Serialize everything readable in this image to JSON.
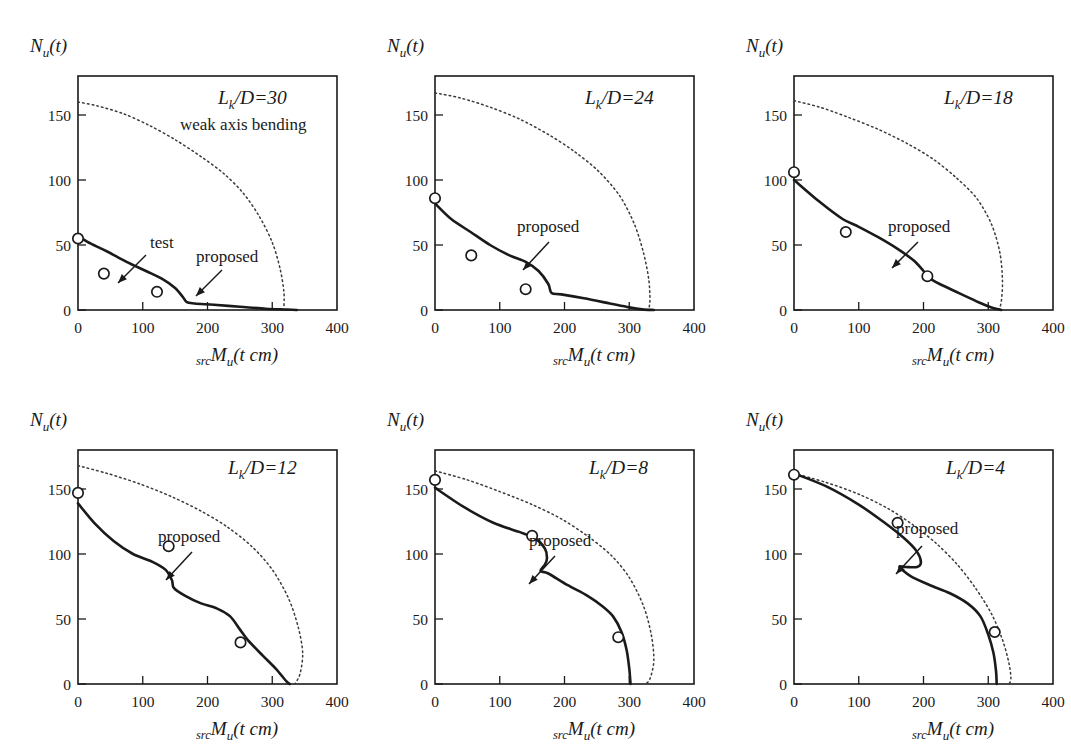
{
  "figure": {
    "panel_count": 6,
    "rows": 2,
    "cols": 3,
    "y_axis_title": "N",
    "y_axis_sub": "u",
    "y_axis_tail": "(t)",
    "x_axis_pre": "src",
    "x_axis_main": "M",
    "x_axis_sub": "u",
    "x_axis_tail": "(t cm)",
    "label_weak": "weak axis bending",
    "label_test": "test",
    "label_proposed": "proposed",
    "label_lk_prefix": "L",
    "label_lk_sub": "k",
    "colors": {
      "ink": "#1a1a1a",
      "dotted": "#3a3a3a",
      "background": "#ffffff"
    }
  },
  "chart_data": [
    {
      "type": "line",
      "title": "L_k/D=30",
      "slenderness_label": "/D=30",
      "slenderness_value": 30,
      "xlabel": "srcMu(t cm)",
      "ylabel": "Nu(t)",
      "xlim": [
        0,
        400
      ],
      "ylim": [
        0,
        180
      ],
      "xticks": [
        0,
        100,
        200,
        300,
        400
      ],
      "yticks": [
        0,
        50,
        100,
        150
      ],
      "grid": false,
      "legend": [
        "weak axis bending",
        "proposed",
        "test"
      ],
      "annotations": [
        "weak axis bending",
        "test",
        "proposed"
      ],
      "series": [
        {
          "name": "weak axis bending",
          "style": "dotted",
          "points": [
            [
              0,
              160
            ],
            [
              30,
              157
            ],
            [
              70,
              151
            ],
            [
              110,
              142
            ],
            [
              150,
              131
            ],
            [
              190,
              118
            ],
            [
              225,
              105
            ],
            [
              255,
              90
            ],
            [
              280,
              72
            ],
            [
              300,
              52
            ],
            [
              312,
              32
            ],
            [
              318,
              14
            ],
            [
              318,
              2
            ]
          ]
        },
        {
          "name": "proposed",
          "style": "solid",
          "points": [
            [
              0,
              57
            ],
            [
              20,
              51
            ],
            [
              45,
              45
            ],
            [
              75,
              37
            ],
            [
              105,
              30
            ],
            [
              130,
              24
            ],
            [
              150,
              17
            ],
            [
              162,
              10
            ],
            [
              168,
              6
            ],
            [
              180,
              5
            ],
            [
              210,
              4
            ],
            [
              250,
              2.5
            ],
            [
              290,
              1
            ],
            [
              320,
              0.4
            ],
            [
              338,
              0
            ]
          ]
        }
      ],
      "test_points": [
        [
          0,
          55
        ],
        [
          40,
          28
        ],
        [
          122,
          14
        ]
      ]
    },
    {
      "type": "line",
      "title": "L_k/D=24",
      "slenderness_label": "/D=24",
      "slenderness_value": 24,
      "xlabel": "srcMu(t cm)",
      "ylabel": "Nu(t)",
      "xlim": [
        0,
        400
      ],
      "ylim": [
        0,
        180
      ],
      "xticks": [
        0,
        100,
        200,
        300,
        400
      ],
      "yticks": [
        0,
        50,
        100,
        150
      ],
      "grid": false,
      "legend": [
        "weak axis bending",
        "proposed",
        "test"
      ],
      "annotations": [
        "proposed"
      ],
      "series": [
        {
          "name": "weak axis bending",
          "style": "dotted",
          "points": [
            [
              0,
              167
            ],
            [
              40,
              163
            ],
            [
              85,
              156
            ],
            [
              130,
              147
            ],
            [
              175,
              135
            ],
            [
              215,
              122
            ],
            [
              252,
              107
            ],
            [
              285,
              88
            ],
            [
              308,
              66
            ],
            [
              322,
              44
            ],
            [
              330,
              24
            ],
            [
              332,
              8
            ],
            [
              330,
              0
            ]
          ]
        },
        {
          "name": "proposed",
          "style": "solid",
          "points": [
            [
              0,
              82
            ],
            [
              25,
              70
            ],
            [
              55,
              60
            ],
            [
              85,
              50
            ],
            [
              115,
              42
            ],
            [
              140,
              37
            ],
            [
              160,
              30
            ],
            [
              175,
              20
            ],
            [
              180,
              13
            ],
            [
              195,
              12
            ],
            [
              230,
              9
            ],
            [
              270,
              5
            ],
            [
              300,
              2
            ],
            [
              320,
              0.5
            ],
            [
              338,
              0
            ]
          ]
        }
      ],
      "test_points": [
        [
          0,
          86
        ],
        [
          56,
          42
        ],
        [
          140,
          16
        ]
      ]
    },
    {
      "type": "line",
      "title": "L_k/D=18",
      "slenderness_label": "/D=18",
      "slenderness_value": 18,
      "xlabel": "srcMu(t cm)",
      "ylabel": "Nu(t)",
      "xlim": [
        0,
        400
      ],
      "ylim": [
        0,
        180
      ],
      "xticks": [
        0,
        100,
        200,
        300,
        400
      ],
      "yticks": [
        0,
        50,
        100,
        150
      ],
      "grid": false,
      "legend": [
        "weak axis bending",
        "proposed",
        "test"
      ],
      "annotations": [
        "proposed"
      ],
      "series": [
        {
          "name": "weak axis bending",
          "style": "dotted",
          "points": [
            [
              0,
              161
            ],
            [
              40,
              156
            ],
            [
              85,
              148
            ],
            [
              130,
              139
            ],
            [
              175,
              128
            ],
            [
              215,
              116
            ],
            [
              250,
              102
            ],
            [
              282,
              86
            ],
            [
              305,
              66
            ],
            [
              318,
              44
            ],
            [
              322,
              22
            ],
            [
              320,
              6
            ],
            [
              316,
              0
            ]
          ]
        },
        {
          "name": "proposed",
          "style": "solid",
          "points": [
            [
              0,
              100
            ],
            [
              40,
              83
            ],
            [
              75,
              70
            ],
            [
              100,
              64
            ],
            [
              130,
              56
            ],
            [
              160,
              47
            ],
            [
              185,
              38
            ],
            [
              200,
              30
            ],
            [
              208,
              25
            ],
            [
              225,
              20
            ],
            [
              255,
              13
            ],
            [
              285,
              6
            ],
            [
              305,
              2
            ],
            [
              320,
              0
            ]
          ]
        }
      ],
      "test_points": [
        [
          0,
          106
        ],
        [
          80,
          60
        ],
        [
          206,
          26
        ]
      ]
    },
    {
      "type": "line",
      "title": "L_k/D=12",
      "slenderness_label": "/D=12",
      "slenderness_value": 12,
      "xlabel": "srcMu(t cm)",
      "ylabel": "Nu(t)",
      "xlim": [
        0,
        400
      ],
      "ylim": [
        0,
        180
      ],
      "xticks": [
        0,
        100,
        200,
        300,
        400
      ],
      "yticks": [
        0,
        50,
        100,
        150
      ],
      "grid": false,
      "legend": [
        "weak axis bending",
        "proposed",
        "test"
      ],
      "annotations": [
        "proposed"
      ],
      "series": [
        {
          "name": "weak axis bending",
          "style": "dotted",
          "points": [
            [
              0,
              168
            ],
            [
              45,
              162
            ],
            [
              95,
              154
            ],
            [
              145,
              144
            ],
            [
              190,
              133
            ],
            [
              230,
              121
            ],
            [
              268,
              106
            ],
            [
              300,
              88
            ],
            [
              325,
              66
            ],
            [
              340,
              44
            ],
            [
              347,
              24
            ],
            [
              343,
              8
            ],
            [
              335,
              0
            ]
          ]
        },
        {
          "name": "proposed",
          "style": "solid",
          "points": [
            [
              0,
              139
            ],
            [
              25,
              124
            ],
            [
              55,
              110
            ],
            [
              85,
              100
            ],
            [
              115,
              94
            ],
            [
              135,
              88
            ],
            [
              145,
              80
            ],
            [
              148,
              74
            ],
            [
              165,
              68
            ],
            [
              190,
              62
            ],
            [
              215,
              58
            ],
            [
              235,
              52
            ],
            [
              250,
              42
            ],
            [
              262,
              34
            ],
            [
              285,
              22
            ],
            [
              305,
              12
            ],
            [
              322,
              2
            ],
            [
              327,
              0
            ]
          ]
        }
      ],
      "test_points": [
        [
          0,
          147
        ],
        [
          140,
          106
        ],
        [
          251,
          32
        ]
      ]
    },
    {
      "type": "line",
      "title": "L_k/D=8",
      "slenderness_label": "/D=8",
      "slenderness_value": 8,
      "xlabel": "srcMu(t cm)",
      "ylabel": "Nu(t)",
      "xlim": [
        0,
        400
      ],
      "ylim": [
        0,
        180
      ],
      "xticks": [
        0,
        100,
        200,
        300,
        400
      ],
      "yticks": [
        0,
        50,
        100,
        150
      ],
      "grid": false,
      "legend": [
        "weak axis bending",
        "proposed",
        "test"
      ],
      "annotations": [
        "proposed"
      ],
      "series": [
        {
          "name": "weak axis bending",
          "style": "dotted",
          "points": [
            [
              0,
              164
            ],
            [
              50,
              157
            ],
            [
              100,
              148
            ],
            [
              150,
              138
            ],
            [
              195,
              127
            ],
            [
              235,
              114
            ],
            [
              272,
              99
            ],
            [
              300,
              82
            ],
            [
              322,
              60
            ],
            [
              334,
              38
            ],
            [
              338,
              18
            ],
            [
              332,
              4
            ],
            [
              325,
              0
            ]
          ]
        },
        {
          "name": "proposed",
          "style": "solid",
          "points": [
            [
              0,
              151
            ],
            [
              45,
              136
            ],
            [
              90,
              124
            ],
            [
              130,
              117
            ],
            [
              155,
              112
            ],
            [
              170,
              104
            ],
            [
              173,
              97
            ],
            [
              170,
              92
            ],
            [
              163,
              87
            ],
            [
              175,
              85
            ],
            [
              205,
              76
            ],
            [
              235,
              68
            ],
            [
              258,
              60
            ],
            [
              275,
              52
            ],
            [
              288,
              40
            ],
            [
              296,
              26
            ],
            [
              300,
              12
            ],
            [
              302,
              0
            ]
          ]
        }
      ],
      "test_points": [
        [
          0,
          157
        ],
        [
          150,
          114
        ],
        [
          283,
          36
        ]
      ]
    },
    {
      "type": "line",
      "title": "L_k/D=4",
      "slenderness_label": "/D=4",
      "slenderness_value": 4,
      "xlabel": "srcMu(t cm)",
      "ylabel": "Nu(t)",
      "xlim": [
        0,
        400
      ],
      "ylim": [
        0,
        180
      ],
      "xticks": [
        0,
        100,
        200,
        300,
        400
      ],
      "yticks": [
        0,
        50,
        100,
        150
      ],
      "grid": false,
      "legend": [
        "weak axis bending",
        "proposed",
        "test"
      ],
      "annotations": [
        "proposed"
      ],
      "series": [
        {
          "name": "weak axis bending",
          "style": "dotted",
          "points": [
            [
              0,
              162
            ],
            [
              50,
              155
            ],
            [
              100,
              146
            ],
            [
              145,
              135
            ],
            [
              185,
              122
            ],
            [
              220,
              108
            ],
            [
              252,
              92
            ],
            [
              280,
              74
            ],
            [
              305,
              54
            ],
            [
              322,
              34
            ],
            [
              332,
              16
            ],
            [
              335,
              4
            ],
            [
              332,
              0
            ]
          ]
        },
        {
          "name": "proposed",
          "style": "solid",
          "points": [
            [
              0,
              162
            ],
            [
              50,
              152
            ],
            [
              100,
              138
            ],
            [
              140,
              124
            ],
            [
              168,
              113
            ],
            [
              188,
              103
            ],
            [
              196,
              94
            ],
            [
              190,
              90
            ],
            [
              172,
              90
            ],
            [
              163,
              90
            ],
            [
              180,
              83
            ],
            [
              210,
              76
            ],
            [
              240,
              70
            ],
            [
              268,
              62
            ],
            [
              288,
              52
            ],
            [
              300,
              38
            ],
            [
              308,
              24
            ],
            [
              312,
              10
            ],
            [
              313,
              0
            ]
          ]
        }
      ],
      "test_points": [
        [
          0,
          161
        ],
        [
          160,
          124
        ],
        [
          310,
          40
        ]
      ]
    }
  ]
}
